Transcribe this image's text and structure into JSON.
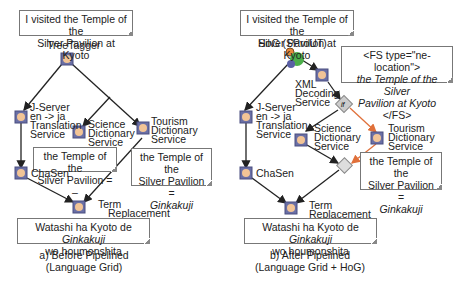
{
  "left": {
    "input_note": [
      "I visited the Temple of the",
      "Silver Pavilion at Kyoto"
    ],
    "root_label": "TreeTagger",
    "nodes": {
      "jserver": [
        "J-Server",
        "en -> ja",
        "Translation",
        "Service"
      ],
      "science": [
        "Science",
        "Dictionary",
        "Service"
      ],
      "tourism": [
        "Tourism",
        "Dictionary",
        "Service"
      ],
      "chasen": "ChaSen",
      "term": [
        "Term",
        "Replacement"
      ]
    },
    "science_result": [
      "the Temple of the",
      "Silver Pavilion = –"
    ],
    "tourism_result": {
      "line1": "the Temple of the",
      "line2": "Silver Pavilion =",
      "line3": "Ginkakuji"
    },
    "output_note": {
      "pre": "Watashi ha Kyoto de ",
      "italic": "Ginkakuji",
      "line2": "wo houmonshita"
    },
    "caption": [
      "a) Before Pipelined",
      "(Language Grid)"
    ]
  },
  "right": {
    "input_note": [
      "I visited the Temple of the",
      "Silver Pavilion at Kyoto"
    ],
    "root_label": "HoG (SProUT)",
    "fs_note": {
      "line1": "<FS type=\"ne-location\">",
      "line2": "the Temple of the Silver",
      "line3_italic": "Pavilion at Kyoto",
      "line3_tail": " </FS>"
    },
    "nodes": {
      "xml": [
        "XML",
        "Decoding",
        "Service"
      ],
      "if_label": "if",
      "jserver": [
        "J-Server",
        "en -> ja",
        "Translation",
        "Service"
      ],
      "science": [
        "Science",
        "Dictionary",
        "Service"
      ],
      "tourism": [
        "Tourism",
        "Dictionary",
        "Service"
      ],
      "chasen": "ChaSen",
      "term": [
        "Term",
        "Replacement"
      ]
    },
    "tourism_result": {
      "line1": "the Temple of the",
      "line2": "Silver Pavilion =",
      "line3": "Ginkakuji"
    },
    "output_note": {
      "pre": "Watashi ha Kyoto de ",
      "italic": "Ginkakuji",
      "line2": "wo houmonshita"
    },
    "caption": [
      "b) After Pipelined",
      "(Language Grid + HoG)"
    ]
  },
  "colors": {
    "node_border": "#5a5f8f",
    "node_fill": "#f2c496",
    "arrow": "#222222",
    "orange_arrow": "#e0703a"
  }
}
